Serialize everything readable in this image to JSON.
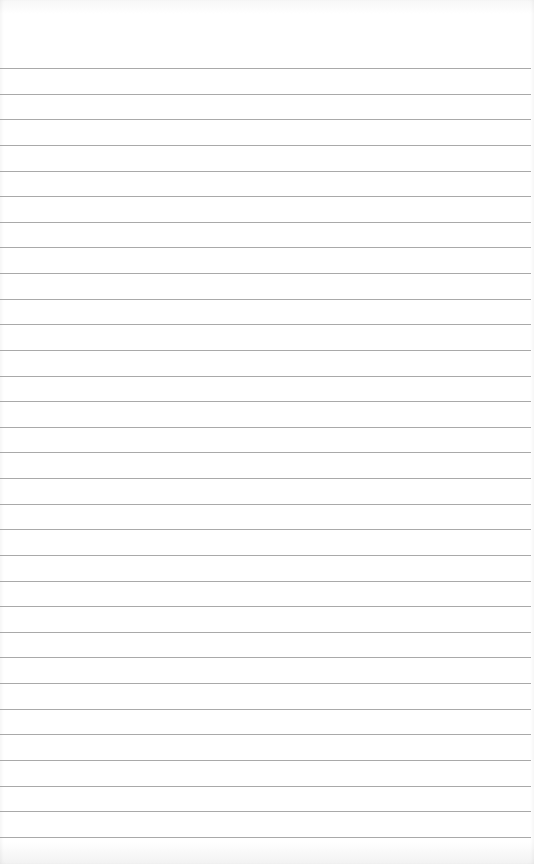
{
  "sheet": {
    "type": "lined-paper",
    "background_color": "#ffffff",
    "rule_color": "#9a9a9a",
    "rule_count": 31,
    "first_rule_y": 68,
    "rule_spacing": 25.63
  }
}
